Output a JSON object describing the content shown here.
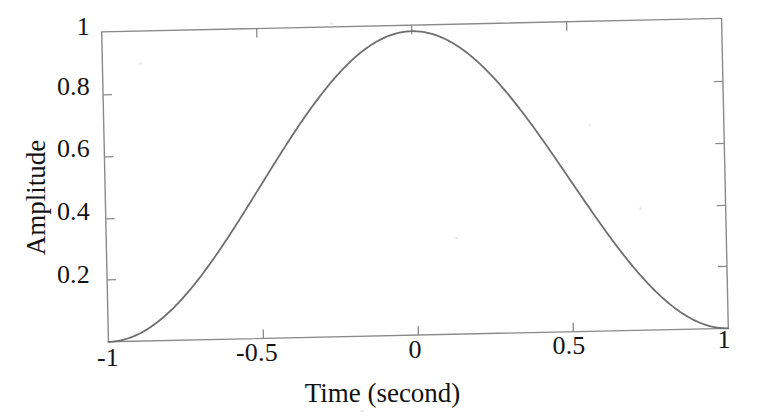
{
  "figure": {
    "background_color": "#ffffff",
    "line_color": "#6f6f6f",
    "axis_color": "#8a8a8a",
    "text_color": "#121212"
  },
  "chart_data": {
    "type": "line",
    "title": "",
    "subtitle": "",
    "xlabel": "Time (second)",
    "ylabel": "Amplitude",
    "xlim": [
      -1,
      1
    ],
    "ylim": [
      0,
      1.02
    ],
    "xticks": [
      -1,
      -0.5,
      0,
      0.5,
      1
    ],
    "xtick_labels": [
      "-1",
      "-0.5",
      "0",
      "0.5",
      "1"
    ],
    "yticks": [
      0.2,
      0.4,
      0.6,
      0.8,
      1
    ],
    "ytick_labels": [
      "0.2",
      "0.4",
      "0.6",
      "0.8",
      "1"
    ],
    "grid": false,
    "legend": null,
    "legend_position": "none",
    "annotations": [],
    "tick_direction": "in",
    "box": true,
    "series": [
      {
        "name": "raised-cosine (Hann) window",
        "equation": "0.5*(1+cos(pi*t))",
        "x": [
          -1,
          -0.95,
          -0.9,
          -0.85,
          -0.8,
          -0.75,
          -0.7,
          -0.65,
          -0.6,
          -0.55,
          -0.5,
          -0.45,
          -0.4,
          -0.35,
          -0.3,
          -0.25,
          -0.2,
          -0.15,
          -0.1,
          -0.05,
          0,
          0.05,
          0.1,
          0.15,
          0.2,
          0.25,
          0.3,
          0.35,
          0.4,
          0.45,
          0.5,
          0.55,
          0.6,
          0.65,
          0.7,
          0.75,
          0.8,
          0.85,
          0.9,
          0.95,
          1
        ],
        "y": [
          0,
          0.006,
          0.024,
          0.054,
          0.095,
          0.146,
          0.206,
          0.273,
          0.345,
          0.422,
          0.5,
          0.578,
          0.655,
          0.727,
          0.794,
          0.854,
          0.905,
          0.946,
          0.976,
          0.994,
          1,
          0.994,
          0.976,
          0.946,
          0.905,
          0.854,
          0.794,
          0.727,
          0.655,
          0.578,
          0.5,
          0.422,
          0.345,
          0.273,
          0.206,
          0.146,
          0.095,
          0.054,
          0.024,
          0.006,
          0
        ]
      }
    ]
  },
  "axes": {
    "y_tick_labels": [
      "1",
      "0.8",
      "0.6",
      "0.4",
      "0.2"
    ],
    "x_tick_labels": [
      "-1",
      "-0.5",
      "0",
      "0.5",
      "1"
    ],
    "x_title": "Time (second)",
    "y_title": "Amplitude"
  }
}
